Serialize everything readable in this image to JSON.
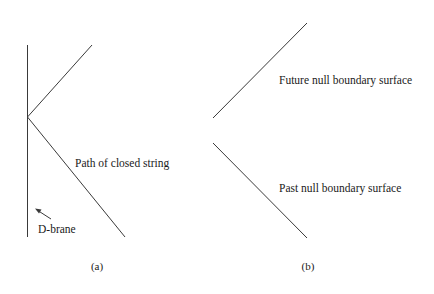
{
  "figure": {
    "stroke_color": "#3a3a3a",
    "panels": [
      {
        "id": "a",
        "caption": "(a)",
        "labels": {
          "path": "Path of closed string",
          "brane": "D-brane"
        }
      },
      {
        "id": "b",
        "caption": "(b)",
        "labels": {
          "future": "Future null boundary surface",
          "past": "Past null boundary surface"
        }
      }
    ]
  }
}
